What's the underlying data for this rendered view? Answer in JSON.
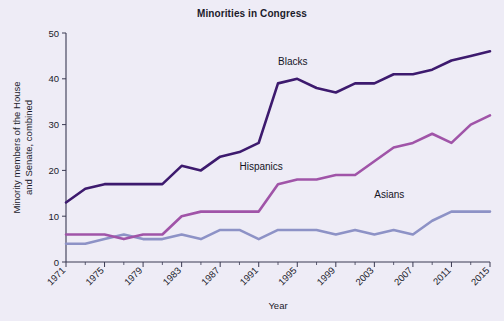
{
  "chart_data": {
    "type": "line",
    "title": "Minorities in Congress",
    "xlabel": "Year",
    "ylabel": "Minority members of the House and Senate, combined",
    "xlim": [
      1971,
      2015
    ],
    "ylim": [
      0,
      50
    ],
    "yticks": [
      0,
      10,
      20,
      30,
      40,
      50
    ],
    "xticks": [
      1971,
      1975,
      1979,
      1983,
      1987,
      1991,
      1995,
      1999,
      2003,
      2007,
      2011,
      2015
    ],
    "xtick_labels": [
      "1971",
      "1975",
      "1979",
      "1983",
      "1987",
      "1991",
      "1995",
      "1999",
      "2003",
      "2007",
      "2011",
      "2015"
    ],
    "ytick_labels": [
      "0",
      "10",
      "20",
      "30",
      "40",
      "50"
    ],
    "grid": false,
    "legend_position": "inline-annotations",
    "x": [
      1971,
      1973,
      1975,
      1977,
      1979,
      1981,
      1983,
      1985,
      1987,
      1989,
      1991,
      1993,
      1995,
      1997,
      1999,
      2001,
      2003,
      2005,
      2007,
      2009,
      2011,
      2013,
      2015
    ],
    "series": [
      {
        "name": "Blacks",
        "color": "#3d1a6e",
        "values": [
          13,
          16,
          17,
          17,
          17,
          17,
          21,
          20,
          23,
          24,
          26,
          39,
          40,
          38,
          37,
          39,
          39,
          41,
          41,
          42,
          44,
          45,
          46
        ]
      },
      {
        "name": "Hispanics",
        "color": "#a054a8",
        "values": [
          6,
          6,
          6,
          5,
          6,
          6,
          10,
          11,
          11,
          11,
          11,
          17,
          18,
          18,
          19,
          19,
          22,
          25,
          26,
          28,
          26,
          30,
          32
        ]
      },
      {
        "name": "Asians",
        "color": "#8d92c6",
        "values": [
          4,
          4,
          5,
          6,
          5,
          5,
          6,
          5,
          7,
          7,
          5,
          7,
          7,
          7,
          6,
          7,
          6,
          7,
          6,
          9,
          11,
          11,
          11
        ]
      }
    ],
    "annotations": [
      {
        "text": "Blacks",
        "x": 1993,
        "y": 43
      },
      {
        "text": "Hispanics",
        "x": 1989,
        "y": 20
      },
      {
        "text": "Asians",
        "x": 2003,
        "y": 14
      }
    ]
  },
  "figure": {
    "background_color": "#eeecf6",
    "axis_color": "#3a3a52",
    "text_color": "#1b1b2b"
  }
}
